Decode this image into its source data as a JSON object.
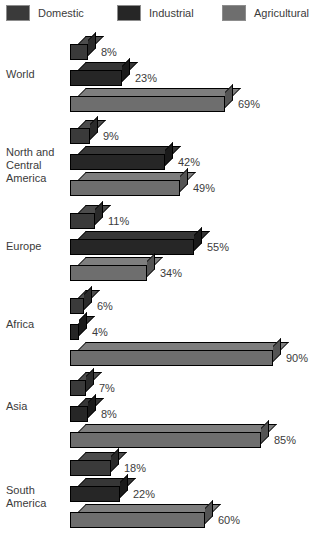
{
  "chart_data": {
    "type": "bar",
    "orientation": "horizontal",
    "title": "",
    "xlabel": "",
    "ylabel": "",
    "xlim": [
      0,
      100
    ],
    "grid": false,
    "legend_position": "top",
    "value_suffix": "%",
    "categories": [
      "World",
      "North and\nCentral\nAmerica",
      "Europe",
      "Africa",
      "Asia",
      "South\nAmerica"
    ],
    "series": [
      {
        "name": "Domestic",
        "color": "#3a3a3a",
        "values": [
          8,
          9,
          11,
          6,
          7,
          18
        ]
      },
      {
        "name": "Industrial",
        "color": "#262626",
        "values": [
          23,
          42,
          55,
          4,
          8,
          22
        ]
      },
      {
        "name": "Agricultural",
        "color": "#6e6e6e",
        "values": [
          69,
          49,
          34,
          90,
          85,
          60
        ]
      }
    ],
    "data_labels": [
      [
        "8%",
        "23%",
        "69%"
      ],
      [
        "9%",
        "42%",
        "49%"
      ],
      [
        "11%",
        "55%",
        "34%"
      ],
      [
        "6%",
        "4%",
        "90%"
      ],
      [
        "7%",
        "8%",
        "85%"
      ],
      [
        "18%",
        "22%",
        "60%"
      ]
    ]
  },
  "legend": {
    "items": [
      {
        "label": "Domestic",
        "color": "#3a3a3a",
        "swatch_class": "sw-domestic"
      },
      {
        "label": "Industrial",
        "color": "#262626",
        "swatch_class": "sw-industrial"
      },
      {
        "label": "Agricultural",
        "color": "#6e6e6e",
        "swatch_class": "sw-agricultural"
      }
    ]
  },
  "layout": {
    "bar_origin_x": 70,
    "px_per_percent": 2.25,
    "bar_front_height": 16,
    "depth": 8,
    "bar_pitch": 26,
    "group_tops": [
      36,
      120,
      205,
      290,
      372,
      452
    ],
    "label_tops": [
      68,
      146,
      240,
      318,
      400,
      484
    ]
  }
}
